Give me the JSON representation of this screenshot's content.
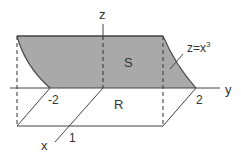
{
  "diagram": {
    "type": "3d-region-sketch",
    "colors": {
      "shade": "#a9a9a9",
      "line": "#444444",
      "background": "#ffffff"
    },
    "axes": {
      "z_label": "z",
      "y_label": "y",
      "x_label": "x"
    },
    "ticks": {
      "y_neg": "-2",
      "y_pos": "2",
      "x_one": "1"
    },
    "regions": {
      "surface_label": "S",
      "base_label": "R"
    },
    "curve_label": {
      "prefix": "z=x",
      "exponent": "3"
    }
  }
}
